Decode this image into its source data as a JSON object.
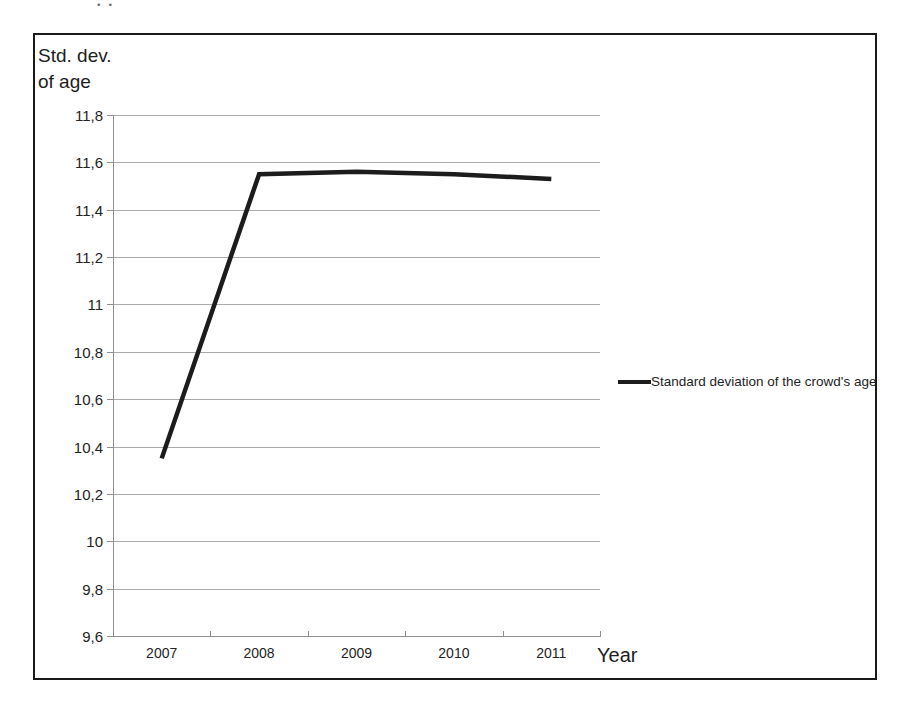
{
  "figure": {
    "y_axis_title": "Std. dev.\nof age",
    "x_axis_title": "Year",
    "scan_artifact_text": "..",
    "frame_color": "#1a1a1a",
    "series_color": "#1c1c1c",
    "gridline_color": "#9a9a9a"
  },
  "legend": {
    "position": "right",
    "entries": [
      {
        "label": "Standard deviation of the crowd's age",
        "color": "#1c1c1c"
      }
    ]
  },
  "chart_data": {
    "type": "line",
    "title": "",
    "xlabel": "Year",
    "ylabel": "Std. dev. of age",
    "categories": [
      "2007",
      "2008",
      "2009",
      "2010",
      "2011"
    ],
    "x": [
      2007,
      2008,
      2009,
      2010,
      2011
    ],
    "series": [
      {
        "name": "Standard deviation of the crowd's age",
        "color": "#1c1c1c",
        "values": [
          10.35,
          11.55,
          11.56,
          11.55,
          11.53
        ]
      }
    ],
    "ylim": [
      9.6,
      11.8
    ],
    "yticks": [
      9.6,
      9.8,
      10.0,
      10.2,
      10.4,
      10.6,
      10.8,
      11.0,
      11.2,
      11.4,
      11.6,
      11.8
    ],
    "ytick_labels": [
      "9,6",
      "9,8",
      "10",
      "10,2",
      "10,4",
      "10,6",
      "10,8",
      "11",
      "11,2",
      "11,4",
      "11,6",
      "11,8"
    ],
    "xtick_labels": [
      "2007",
      "2008",
      "2009",
      "2010",
      "2011"
    ],
    "decimal_separator": ",",
    "grid": true,
    "grid_axis": "y",
    "legend_position": "right"
  }
}
